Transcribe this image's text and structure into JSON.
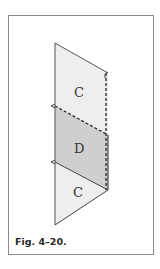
{
  "figure": {
    "caption": "Fig. 4–20.",
    "panels": [
      {
        "label": "C",
        "position": "top",
        "fill": "#eeeeee"
      },
      {
        "label": "D",
        "position": "middle",
        "fill": "#cfcfcf"
      },
      {
        "label": "C",
        "position": "bottom",
        "fill": "#eeeeee"
      }
    ],
    "colors": {
      "frame": "#8a8a8a",
      "stroke": "#444444",
      "light_panel": "#eeeeee",
      "dark_panel": "#cfcfcf"
    }
  }
}
